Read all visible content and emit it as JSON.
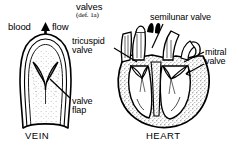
{
  "figure": {
    "type": "anatomical-line-drawing",
    "subject": "valves",
    "background_color": "#ffffff",
    "ink_color": "#000000",
    "stipple_color": "#4a4a4a"
  },
  "title": {
    "headword": "valves",
    "sense": "(def. 1a)"
  },
  "labels": {
    "blood": "blood",
    "flow": "flow",
    "semilunar": "semilunar valve",
    "tricuspid_line1": "tricuspid",
    "tricuspid_line2": "valve",
    "mitral_line1": "mitral",
    "mitral_line2": "valve",
    "valve_flap_line1": "valve",
    "valve_flap_line2": "flap"
  },
  "captions": {
    "vein": "VEIN",
    "heart": "HEART"
  },
  "icons": {
    "blood_flow_arrow": "up-arrow-icon"
  }
}
